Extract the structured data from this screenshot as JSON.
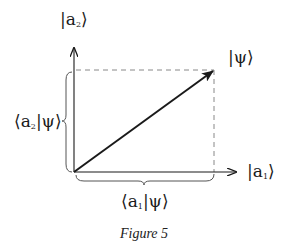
{
  "figure": {
    "caption": "Figure 5",
    "labels": {
      "y_axis": {
        "open": "|a",
        "sub": "2",
        "close": "⟩"
      },
      "x_axis": {
        "open": "|a",
        "sub": "1",
        "close": "⟩"
      },
      "vector": "|ψ⟩",
      "y_component": {
        "open": "⟨a",
        "sub": "2",
        "close": "|ψ⟩"
      },
      "x_component": {
        "open": "⟨a",
        "sub": "1",
        "close": "|ψ⟩"
      }
    },
    "geometry": {
      "origin": [
        74,
        172
      ],
      "x_axis_end": [
        236,
        172
      ],
      "y_axis_end": [
        74,
        47
      ],
      "vector_tip": [
        214,
        70
      ]
    },
    "colors": {
      "ink": "#1a1a1a",
      "dashed": "#888888",
      "brace": "#666666"
    }
  }
}
